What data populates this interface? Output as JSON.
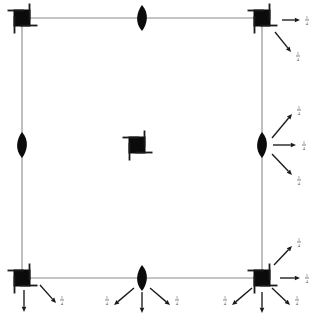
{
  "figure": {
    "background_color": "#ffffff",
    "width": 318,
    "height": 314,
    "line_color": "#8a8a8a",
    "marker_color": "#0b0b0b",
    "arrow_color": "#1a1a1a",
    "label_color": "#4a4a4a"
  },
  "frame": {
    "name": "square-frame",
    "left": 22,
    "right": 262,
    "top": 18,
    "bottom": 278,
    "stroke_width": 1.1
  },
  "supports": [
    {
      "id": "top-left",
      "type": "fixed-square",
      "label": "fixed-support",
      "x": 22,
      "y": 18,
      "size": 17,
      "arrow_count": 0
    },
    {
      "id": "top-center",
      "type": "lens",
      "label": "pin-lens",
      "x": 142,
      "y": 18,
      "rx": 5,
      "ry": 13,
      "arrow_count": 0
    },
    {
      "id": "top-right",
      "type": "fixed-square",
      "label": "fixed-support",
      "x": 262,
      "y": 18,
      "size": 17,
      "arrow_count": 2
    },
    {
      "id": "mid-left",
      "type": "lens",
      "label": "pin-lens",
      "x": 22,
      "y": 145,
      "rx": 5,
      "ry": 13,
      "arrow_count": 0
    },
    {
      "id": "center",
      "type": "fixed-square",
      "label": "center-block",
      "x": 137,
      "y": 145,
      "size": 17,
      "arrow_count": 0
    },
    {
      "id": "mid-right",
      "type": "lens",
      "label": "pin-lens",
      "x": 262,
      "y": 145,
      "rx": 5,
      "ry": 13,
      "arrow_count": 3
    },
    {
      "id": "bottom-left",
      "type": "fixed-square",
      "label": "fixed-support",
      "x": 22,
      "y": 278,
      "size": 17,
      "arrow_count": 2
    },
    {
      "id": "bottom-center",
      "type": "lens",
      "label": "pin-lens",
      "x": 142,
      "y": 278,
      "rx": 5,
      "ry": 13,
      "arrow_count": 3
    },
    {
      "id": "bottom-right",
      "type": "fixed-square",
      "label": "fixed-support",
      "x": 262,
      "y": 278,
      "size": 17,
      "arrow_count": 5
    }
  ],
  "arrows": [
    {
      "id": "tr-right",
      "origin": "top-right",
      "from_x": 282,
      "from_y": 20,
      "to_x": 300,
      "to_y": 20,
      "label": "1/4",
      "label_num": "1",
      "label_den": "4",
      "label_x": 307,
      "label_y": 20,
      "direction": "right"
    },
    {
      "id": "tr-down-right",
      "origin": "top-right",
      "from_x": 275,
      "from_y": 32,
      "to_x": 291,
      "to_y": 52,
      "label": "1/4",
      "label_num": "1",
      "label_den": "4",
      "label_x": 298,
      "label_y": 56,
      "direction": "down-right"
    },
    {
      "id": "mr-up-right",
      "origin": "mid-right",
      "from_x": 272,
      "from_y": 138,
      "to_x": 292,
      "to_y": 114,
      "label": "1/4",
      "label_num": "1",
      "label_den": "4",
      "label_x": 299,
      "label_y": 110,
      "direction": "up-right"
    },
    {
      "id": "mr-right",
      "origin": "mid-right",
      "from_x": 273,
      "from_y": 145,
      "to_x": 296,
      "to_y": 145,
      "label": "1/4",
      "label_num": "1",
      "label_den": "4",
      "label_x": 304,
      "label_y": 145,
      "direction": "right"
    },
    {
      "id": "mr-down-right",
      "origin": "mid-right",
      "from_x": 272,
      "from_y": 154,
      "to_x": 292,
      "to_y": 175,
      "label": "1/4",
      "label_num": "1",
      "label_den": "4",
      "label_x": 299,
      "label_y": 180,
      "direction": "down-right"
    },
    {
      "id": "bl-down",
      "origin": "bottom-left",
      "from_x": 24,
      "from_y": 290,
      "to_x": 24,
      "to_y": 312,
      "label": "",
      "label_num": "",
      "label_den": "",
      "label_x": 24,
      "label_y": 314,
      "direction": "down"
    },
    {
      "id": "bl-down-right",
      "origin": "bottom-left",
      "from_x": 40,
      "from_y": 285,
      "to_x": 56,
      "to_y": 303,
      "label": "1/4",
      "label_num": "1",
      "label_den": "4",
      "label_x": 62,
      "label_y": 300,
      "direction": "down-right"
    },
    {
      "id": "bc-down-left",
      "origin": "bottom-center",
      "from_x": 134,
      "from_y": 288,
      "to_x": 114,
      "to_y": 305,
      "label": "1/4",
      "label_num": "1",
      "label_den": "4",
      "label_x": 107,
      "label_y": 300,
      "direction": "down-left"
    },
    {
      "id": "bc-down",
      "origin": "bottom-center",
      "from_x": 142,
      "from_y": 292,
      "to_x": 142,
      "to_y": 313,
      "label": "",
      "label_num": "",
      "label_den": "",
      "label_x": 142,
      "label_y": 314,
      "direction": "down"
    },
    {
      "id": "bc-down-right",
      "origin": "bottom-center",
      "from_x": 150,
      "from_y": 288,
      "to_x": 170,
      "to_y": 305,
      "label": "1/4",
      "label_num": "1",
      "label_den": "4",
      "label_x": 177,
      "label_y": 300,
      "direction": "down-right"
    },
    {
      "id": "br-up-right",
      "origin": "bottom-right",
      "from_x": 274,
      "from_y": 265,
      "to_x": 292,
      "to_y": 246,
      "label": "1/4",
      "label_num": "1",
      "label_den": "4",
      "label_x": 299,
      "label_y": 242,
      "direction": "up-right"
    },
    {
      "id": "br-right",
      "origin": "bottom-right",
      "from_x": 280,
      "from_y": 278,
      "to_x": 300,
      "to_y": 278,
      "label": "1/4",
      "label_num": "1",
      "label_den": "4",
      "label_x": 307,
      "label_y": 278,
      "direction": "right"
    },
    {
      "id": "br-down-left",
      "origin": "bottom-right",
      "from_x": 252,
      "from_y": 288,
      "to_x": 232,
      "to_y": 305,
      "label": "1/4",
      "label_num": "1",
      "label_den": "4",
      "label_x": 225,
      "label_y": 300,
      "direction": "down-left"
    },
    {
      "id": "br-down",
      "origin": "bottom-right",
      "from_x": 262,
      "from_y": 292,
      "to_x": 262,
      "to_y": 313,
      "label": "",
      "label_num": "",
      "label_den": "",
      "label_x": 262,
      "label_y": 314,
      "direction": "down"
    },
    {
      "id": "br-down-right",
      "origin": "bottom-right",
      "from_x": 272,
      "from_y": 288,
      "to_x": 290,
      "to_y": 305,
      "label": "1/4",
      "label_num": "1",
      "label_den": "4",
      "label_x": 297,
      "label_y": 300,
      "direction": "down-right"
    }
  ]
}
